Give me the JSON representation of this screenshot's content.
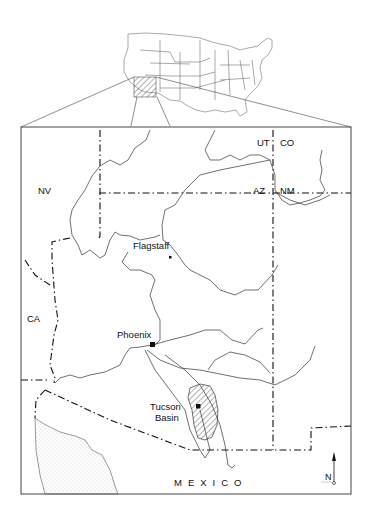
{
  "map": {
    "inset": {
      "label": "United States locator map",
      "highlight": "Arizona region (hatched)"
    },
    "states": [
      {
        "code": "UT",
        "x": 257,
        "y": 146
      },
      {
        "code": "CO",
        "x": 280,
        "y": 146
      },
      {
        "code": "NV",
        "x": 38,
        "y": 194
      },
      {
        "code": "AZ",
        "x": 253,
        "y": 194
      },
      {
        "code": "NM",
        "x": 280,
        "y": 194
      },
      {
        "code": "CA",
        "x": 27,
        "y": 322
      }
    ],
    "cities": [
      {
        "name": "Flagstaff",
        "x": 133,
        "y": 249,
        "marker_x": 170,
        "marker_y": 257,
        "marker_size": 2.5
      },
      {
        "name": "Phoenix",
        "x": 117,
        "y": 338,
        "marker_x": 152,
        "marker_y": 344,
        "marker_size": 5
      }
    ],
    "region": {
      "line1": "Tucson",
      "line2": "Basin",
      "x": 150,
      "y": 410,
      "marker_x": 198,
      "marker_y": 406
    },
    "country_label": "MEXICO",
    "north_arrow": "N",
    "colors": {
      "ink": "#111111",
      "river": "#333333",
      "background": "#ffffff",
      "stipple": "#9a9a9a"
    }
  }
}
